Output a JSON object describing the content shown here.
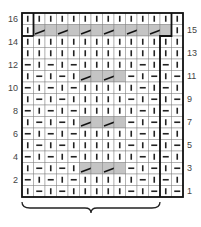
{
  "chart_data": {
    "type": "table",
    "title": "",
    "columns": 14,
    "rows_count": 16,
    "repeat_columns": [
      1,
      12
    ],
    "row_labels_left": [
      16,
      14,
      12,
      10,
      8,
      6,
      4,
      2
    ],
    "row_labels_right": [
      15,
      13,
      11,
      9,
      7,
      5,
      3,
      1
    ],
    "rows": [
      {
        "row": 16,
        "cells": [
          "K",
          "K",
          "K",
          "K",
          "K",
          "K",
          "K",
          "K",
          "K",
          "K",
          "K",
          "K",
          "K",
          "K"
        ]
      },
      {
        "row": 15,
        "cells": [
          "K",
          "C",
          "c",
          "C",
          "c",
          "C",
          "c",
          "C",
          "c",
          "C",
          "c",
          "C",
          "c",
          "K"
        ]
      },
      {
        "row": 14,
        "cells": [
          "K",
          "K",
          "K",
          "K",
          "K",
          "K",
          "K",
          "K",
          "K",
          "K",
          "K",
          "K",
          "K",
          "K"
        ]
      },
      {
        "row": 13,
        "cells": [
          "K",
          "K",
          "K",
          "K",
          "K",
          "K",
          "K",
          "K",
          "K",
          "K",
          "K",
          "K",
          "K",
          "K"
        ]
      },
      {
        "row": 12,
        "cells": [
          "P",
          "K",
          "P",
          "K",
          "P",
          "K",
          "K",
          "K",
          "K",
          "K",
          "P",
          "K",
          "P",
          "K"
        ]
      },
      {
        "row": 11,
        "cells": [
          "K",
          "P",
          "K",
          "P",
          "K",
          "C",
          "c",
          "C",
          "c",
          "P",
          "K",
          "P",
          "K",
          "P"
        ]
      },
      {
        "row": 10,
        "cells": [
          "P",
          "K",
          "P",
          "K",
          "P",
          "K",
          "K",
          "K",
          "K",
          "K",
          "P",
          "K",
          "P",
          "K"
        ]
      },
      {
        "row": 9,
        "cells": [
          "K",
          "P",
          "K",
          "P",
          "K",
          "K",
          "K",
          "K",
          "K",
          "P",
          "K",
          "P",
          "K",
          "P"
        ]
      },
      {
        "row": 8,
        "cells": [
          "P",
          "K",
          "P",
          "K",
          "P",
          "K",
          "K",
          "K",
          "K",
          "K",
          "P",
          "K",
          "P",
          "K"
        ]
      },
      {
        "row": 7,
        "cells": [
          "K",
          "P",
          "K",
          "P",
          "K",
          "C",
          "c",
          "C",
          "c",
          "P",
          "K",
          "P",
          "K",
          "P"
        ]
      },
      {
        "row": 6,
        "cells": [
          "P",
          "K",
          "P",
          "K",
          "P",
          "K",
          "K",
          "K",
          "K",
          "K",
          "P",
          "K",
          "P",
          "K"
        ]
      },
      {
        "row": 5,
        "cells": [
          "K",
          "P",
          "K",
          "P",
          "K",
          "K",
          "K",
          "K",
          "K",
          "P",
          "K",
          "P",
          "K",
          "P"
        ]
      },
      {
        "row": 4,
        "cells": [
          "P",
          "K",
          "P",
          "K",
          "P",
          "K",
          "K",
          "K",
          "K",
          "K",
          "P",
          "K",
          "P",
          "K"
        ]
      },
      {
        "row": 3,
        "cells": [
          "K",
          "P",
          "K",
          "P",
          "K",
          "C",
          "c",
          "C",
          "c",
          "P",
          "K",
          "P",
          "K",
          "P"
        ]
      },
      {
        "row": 2,
        "cells": [
          "P",
          "K",
          "P",
          "K",
          "P",
          "K",
          "K",
          "K",
          "K",
          "K",
          "P",
          "K",
          "P",
          "K"
        ]
      },
      {
        "row": 1,
        "cells": [
          "K",
          "P",
          "K",
          "P",
          "K",
          "K",
          "K",
          "K",
          "K",
          "P",
          "K",
          "P",
          "K",
          "P"
        ]
      }
    ],
    "colors": {
      "shade": "#c4c4c4",
      "line": "#222222",
      "grid": "#888888"
    }
  }
}
